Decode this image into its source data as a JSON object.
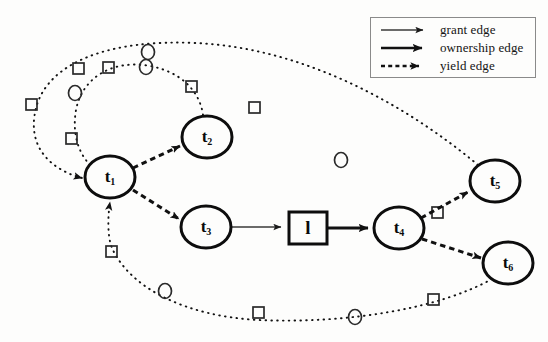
{
  "figure": {
    "background_color": "#fdfdfc",
    "ink_color": "#111111",
    "type": "take-grant-protection-graph"
  },
  "legend": {
    "title": "",
    "border_color": "#8a8a8a",
    "items": [
      {
        "label": "grant edge",
        "style": "thin-solid-arrow",
        "icon": "grant-edge-sample"
      },
      {
        "label": "ownership edge",
        "style": "thick-solid-arrow",
        "icon": "ownership-edge-sample"
      },
      {
        "label": "yield edge",
        "style": "dashed-arrow",
        "icon": "yield-edge-sample"
      }
    ]
  },
  "nodes": [
    {
      "id": "t1",
      "label": "t",
      "sub": "1",
      "shape": "ellipse",
      "cx": 110,
      "cy": 177,
      "rx": 25,
      "ry": 21
    },
    {
      "id": "t2",
      "label": "t",
      "sub": "2",
      "shape": "ellipse",
      "cx": 207,
      "cy": 137,
      "rx": 25,
      "ry": 21
    },
    {
      "id": "t3",
      "label": "t",
      "sub": "3",
      "shape": "ellipse",
      "cx": 206,
      "cy": 227,
      "rx": 25,
      "ry": 21
    },
    {
      "id": "t4",
      "label": "t",
      "sub": "4",
      "shape": "ellipse",
      "cx": 399,
      "cy": 228,
      "rx": 25,
      "ry": 21
    },
    {
      "id": "t5",
      "label": "t",
      "sub": "5",
      "shape": "ellipse",
      "cx": 495,
      "cy": 181,
      "rx": 25,
      "ry": 21
    },
    {
      "id": "t6",
      "label": "t",
      "sub": "6",
      "shape": "ellipse",
      "cx": 508,
      "cy": 263,
      "rx": 25,
      "ry": 21
    },
    {
      "id": "l",
      "label": "l",
      "sub": "",
      "shape": "rect",
      "cx": 308,
      "cy": 228,
      "w": 38,
      "h": 32
    }
  ],
  "edges": [
    {
      "from": "t1",
      "to": "t2",
      "kind": "yield edge"
    },
    {
      "from": "t1",
      "to": "t3",
      "kind": "yield edge"
    },
    {
      "from": "t3",
      "to": "l",
      "kind": "grant edge"
    },
    {
      "from": "l",
      "to": "t4",
      "kind": "ownership edge"
    },
    {
      "from": "t4",
      "to": "t5",
      "kind": "yield edge"
    },
    {
      "from": "t4",
      "to": "t6",
      "kind": "yield edge"
    },
    {
      "from": "t2",
      "to": "t1",
      "kind": "dotted marker path",
      "markers": [
        "square",
        "circle",
        "square",
        "circle",
        "square"
      ]
    },
    {
      "from": "t5",
      "to": "t1",
      "kind": "dotted marker path",
      "markers": [
        "square",
        "circle",
        "square",
        "circle",
        "square"
      ]
    },
    {
      "from": "t6",
      "to": "t1",
      "kind": "dotted marker path",
      "markers": [
        "square",
        "circle",
        "square",
        "circle",
        "square"
      ]
    }
  ],
  "markers": {
    "circle_r": 6,
    "square_s": 11
  }
}
